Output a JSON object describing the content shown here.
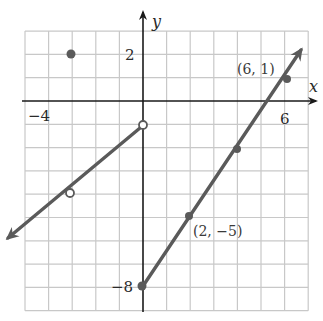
{
  "chart_data": {
    "type": "line",
    "title": "",
    "xlabel": "x",
    "ylabel": "y",
    "xlim": [
      -5,
      7
    ],
    "ylim": [
      -9,
      3
    ],
    "grid": true,
    "tick_labels": {
      "x": [
        {
          "value": -4,
          "label": "−4"
        },
        {
          "value": 6,
          "label": "6"
        }
      ],
      "y": [
        {
          "value": 2,
          "label": "2"
        },
        {
          "value": -8,
          "label": "−8"
        }
      ]
    },
    "series": [
      {
        "name": "left-piece",
        "equation": "y = x - 1",
        "domain": "x < 0",
        "x": [
          -5.8,
          -3,
          0
        ],
        "y": [
          -6.8,
          -4,
          -1
        ],
        "endpoint_open": {
          "x": 0,
          "y": -1
        },
        "open_points": [
          {
            "x": -3,
            "y": -4
          },
          {
            "x": 0,
            "y": -1
          }
        ],
        "arrow": "left"
      },
      {
        "name": "isolated-point",
        "x": [
          -3
        ],
        "y": [
          2
        ],
        "filled": true
      },
      {
        "name": "right-piece",
        "equation": "y = 1.5x - 8",
        "domain": "x >= 0",
        "x": [
          0,
          2,
          4,
          6,
          6.75
        ],
        "y": [
          -8,
          -5,
          -2,
          1,
          2.125
        ],
        "filled_points": [
          {
            "x": 0,
            "y": -8
          },
          {
            "x": 2,
            "y": -5
          },
          {
            "x": 4,
            "y": -2
          },
          {
            "x": 6,
            "y": 1
          }
        ],
        "arrow": "right"
      }
    ],
    "annotations": [
      {
        "text": "(6, 1)",
        "x": 6,
        "y": 1
      },
      {
        "text": "(2, −5)",
        "x": 2,
        "y": -5
      }
    ]
  },
  "labels": {
    "x_axis": "x",
    "y_axis": "y",
    "tick_x_neg4": "−4",
    "tick_x_6": "6",
    "tick_y_2": "2",
    "tick_y_neg8": "−8",
    "annot_6_1": "(6, 1)",
    "annot_2_neg5": "(2, −5)"
  },
  "colors": {
    "curve": "#5a5a5a",
    "axis": "#1a1a1a",
    "grid": "#c8c8c8"
  }
}
